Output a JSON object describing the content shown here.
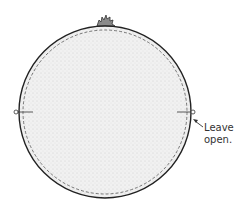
{
  "diagram": {
    "annotation": {
      "line1": "Leave",
      "line2": "open."
    },
    "shape": "circle",
    "elements": [
      "outer-seam-circle",
      "dashed-stitch-line",
      "stippled-fabric-fill",
      "gathered-tuft-top",
      "left-marker",
      "right-marker",
      "arrow-to-opening"
    ],
    "colors": {
      "outline": "#222222",
      "fill": "#ededed",
      "tuft": "#777777",
      "text": "#333333"
    }
  }
}
